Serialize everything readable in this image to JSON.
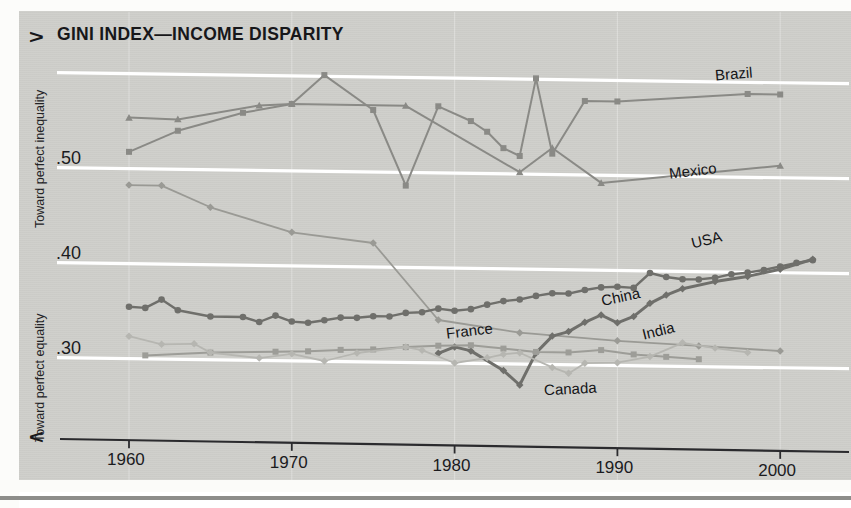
{
  "chart_data": {
    "type": "line",
    "title": "GINI INDEX—INCOME DISPARITY",
    "xlabel": "",
    "ylabel": "",
    "grid": true,
    "legend_position": "inline-end-of-line",
    "xlim": [
      1958,
      2003
    ],
    "ylim": [
      0.255,
      0.625
    ],
    "xticks": [
      1960,
      1970,
      1980,
      1990,
      2000
    ],
    "xticklabels": [
      "1960",
      "1970",
      "1980",
      "1990",
      "2000"
    ],
    "yticks": [
      0.3,
      0.4,
      0.5
    ],
    "yticklabels": [
      ".30",
      ".40",
      ".50"
    ],
    "gridlines_y": [
      0.3,
      0.4,
      0.5,
      0.6
    ],
    "axis_annotations": {
      "top_arrow": "∧",
      "top_text": "Toward perfect inequality",
      "bottom_arrow": "∨",
      "bottom_text": "Toward perfect equality"
    },
    "series": [
      {
        "name": "Brazil",
        "color": "#8a8a86",
        "marker": "square",
        "width": 2.0,
        "label_x": 1996.0,
        "label_y": 0.607,
        "points": [
          [
            1960,
            0.517
          ],
          [
            1963,
            0.54
          ],
          [
            1967,
            0.56
          ],
          [
            1970,
            0.57
          ],
          [
            1972,
            0.601
          ],
          [
            1975,
            0.565
          ],
          [
            1977,
            0.486
          ],
          [
            1979,
            0.57
          ],
          [
            1981,
            0.555
          ],
          [
            1982,
            0.544
          ],
          [
            1983,
            0.527
          ],
          [
            1984,
            0.519
          ],
          [
            1985,
            0.601
          ],
          [
            1986,
            0.522
          ],
          [
            1988,
            0.578
          ],
          [
            1990,
            0.578
          ],
          [
            1998,
            0.588
          ],
          [
            2000,
            0.588
          ]
        ]
      },
      {
        "name": "Mexico",
        "color": "#8a8a86",
        "marker": "triangle",
        "width": 2.0,
        "label_x": 1993.2,
        "label_y": 0.505,
        "points": [
          [
            1960,
            0.553
          ],
          [
            1963,
            0.552
          ],
          [
            1968,
            0.568
          ],
          [
            1970,
            0.57
          ],
          [
            1977,
            0.57
          ],
          [
            1984,
            0.502
          ],
          [
            1986,
            0.528
          ],
          [
            1989,
            0.492
          ],
          [
            2000,
            0.513
          ]
        ]
      },
      {
        "name": "France",
        "color": "#9a9a95",
        "marker": "diamond",
        "width": 1.8,
        "label_x": 1979.5,
        "label_y": 0.333,
        "points": [
          [
            1960,
            0.482
          ],
          [
            1962,
            0.482
          ],
          [
            1965,
            0.46
          ],
          [
            1970,
            0.435
          ],
          [
            1975,
            0.425
          ],
          [
            1979,
            0.345
          ],
          [
            1984,
            0.333
          ],
          [
            1990,
            0.326
          ],
          [
            1995,
            0.322
          ],
          [
            2000,
            0.318
          ]
        ]
      },
      {
        "name": "USA",
        "color": "#6f6f6b",
        "marker": "circle",
        "width": 2.4,
        "label_x": 1994.5,
        "label_y": 0.432,
        "points": [
          [
            1960,
            0.354
          ],
          [
            1961,
            0.353
          ],
          [
            1962,
            0.362
          ],
          [
            1963,
            0.351
          ],
          [
            1965,
            0.345
          ],
          [
            1967,
            0.345
          ],
          [
            1968,
            0.34
          ],
          [
            1969,
            0.347
          ],
          [
            1970,
            0.341
          ],
          [
            1971,
            0.34
          ],
          [
            1972,
            0.343
          ],
          [
            1973,
            0.346
          ],
          [
            1974,
            0.346
          ],
          [
            1975,
            0.348
          ],
          [
            1976,
            0.348
          ],
          [
            1977,
            0.352
          ],
          [
            1978,
            0.353
          ],
          [
            1979,
            0.357
          ],
          [
            1980,
            0.355
          ],
          [
            1981,
            0.357
          ],
          [
            1982,
            0.362
          ],
          [
            1983,
            0.366
          ],
          [
            1984,
            0.368
          ],
          [
            1985,
            0.372
          ],
          [
            1986,
            0.375
          ],
          [
            1987,
            0.375
          ],
          [
            1988,
            0.379
          ],
          [
            1989,
            0.382
          ],
          [
            1990,
            0.383
          ],
          [
            1991,
            0.382
          ],
          [
            1992,
            0.398
          ],
          [
            1993,
            0.394
          ],
          [
            1994,
            0.392
          ],
          [
            1995,
            0.392
          ],
          [
            1996,
            0.394
          ],
          [
            1997,
            0.398
          ],
          [
            1998,
            0.4
          ],
          [
            1999,
            0.403
          ],
          [
            2000,
            0.407
          ],
          [
            2001,
            0.411
          ],
          [
            2002,
            0.414
          ]
        ]
      },
      {
        "name": "China",
        "color": "#6f6f6b",
        "marker": "diamond",
        "width": 3.0,
        "label_x": 1989.0,
        "label_y": 0.371,
        "points": [
          [
            1979,
            0.31
          ],
          [
            1980,
            0.317
          ],
          [
            1981,
            0.313
          ],
          [
            1983,
            0.293
          ],
          [
            1984,
            0.278
          ],
          [
            1985,
            0.312
          ],
          [
            1986,
            0.33
          ],
          [
            1987,
            0.335
          ],
          [
            1988,
            0.345
          ],
          [
            1989,
            0.353
          ],
          [
            1990,
            0.345
          ],
          [
            1991,
            0.352
          ],
          [
            1992,
            0.366
          ],
          [
            1993,
            0.375
          ],
          [
            1994,
            0.382
          ],
          [
            1996,
            0.39
          ],
          [
            1998,
            0.396
          ],
          [
            2000,
            0.404
          ],
          [
            2002,
            0.415
          ]
        ]
      },
      {
        "name": "Canada",
        "color": "#9d9d98",
        "marker": "square",
        "width": 2.0,
        "label_x": 1985.5,
        "label_y": 0.273,
        "points": [
          [
            1961,
            0.303
          ],
          [
            1965,
            0.307
          ],
          [
            1969,
            0.309
          ],
          [
            1971,
            0.31
          ],
          [
            1973,
            0.312
          ],
          [
            1975,
            0.313
          ],
          [
            1977,
            0.316
          ],
          [
            1979,
            0.318
          ],
          [
            1981,
            0.319
          ],
          [
            1983,
            0.316
          ],
          [
            1985,
            0.313
          ],
          [
            1987,
            0.313
          ],
          [
            1989,
            0.316
          ],
          [
            1991,
            0.312
          ],
          [
            1993,
            0.31
          ],
          [
            1995,
            0.308
          ]
        ]
      },
      {
        "name": "India",
        "color": "#b6b6b1",
        "marker": "diamond",
        "width": 1.8,
        "label_x": 1991.5,
        "label_y": 0.336,
        "points": [
          [
            1960,
            0.323
          ],
          [
            1962,
            0.315
          ],
          [
            1964,
            0.316
          ],
          [
            1965,
            0.307
          ],
          [
            1968,
            0.302
          ],
          [
            1970,
            0.307
          ],
          [
            1972,
            0.3
          ],
          [
            1974,
            0.309
          ],
          [
            1977,
            0.316
          ],
          [
            1978,
            0.313
          ],
          [
            1980,
            0.3
          ],
          [
            1982,
            0.306
          ],
          [
            1983,
            0.31
          ],
          [
            1984,
            0.312
          ],
          [
            1986,
            0.297
          ],
          [
            1987,
            0.291
          ],
          [
            1988,
            0.302
          ],
          [
            1990,
            0.303
          ],
          [
            1992,
            0.31
          ],
          [
            1994,
            0.325
          ],
          [
            1996,
            0.32
          ],
          [
            1998,
            0.316
          ]
        ]
      }
    ]
  },
  "figure": {
    "background": "#cfcfcb",
    "grid_color": "#ffffff",
    "axis_color": "#2b2b2e",
    "text_color": "#17171a"
  }
}
